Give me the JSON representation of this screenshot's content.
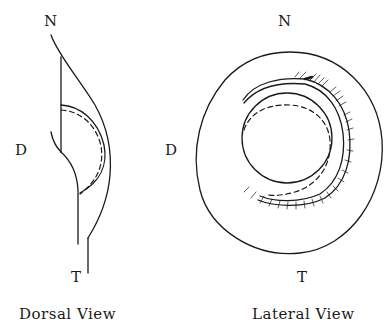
{
  "figure": {
    "colors": {
      "ink": "#1a1a1a",
      "paper": "#ffffff"
    },
    "dorsal_view": {
      "caption": "Dorsal View",
      "labels": {
        "top": "N",
        "left": "D",
        "bottom": "T"
      }
    },
    "lateral_view": {
      "caption": "Lateral View",
      "labels": {
        "top": "N",
        "left": "D",
        "bottom": "T"
      }
    }
  }
}
